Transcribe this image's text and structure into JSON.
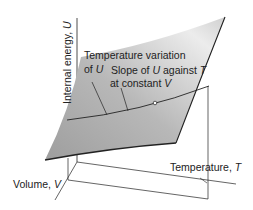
{
  "diagram": {
    "axes": {
      "u_axis_label": "Internal energy,",
      "u_axis_symbol": "U",
      "v_axis_label": "Volume,",
      "v_axis_symbol": "V",
      "t_axis_label": "Temperature,",
      "t_axis_symbol": "T"
    },
    "annotations": {
      "temp_variation_line1": "Temperature variation",
      "temp_variation_line2_prefix": "of",
      "temp_variation_line2_symbol": "U",
      "slope_line1_prefix": "Slope of",
      "slope_line1_symbol_u": "U",
      "slope_line1_mid": "against",
      "slope_line1_symbol_t": "T",
      "slope_line2_prefix": "at constant",
      "slope_line2_symbol": "V"
    },
    "colors": {
      "surface_light": "#e8e8e8",
      "surface_dark": "#a8a8a8",
      "line": "#222222"
    }
  }
}
